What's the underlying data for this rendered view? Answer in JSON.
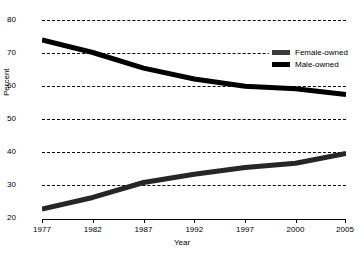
{
  "chart_data": {
    "type": "line",
    "title": "",
    "xlabel": "Year",
    "ylabel": "Percent",
    "xlim": [
      1977,
      2005
    ],
    "ylim": [
      20,
      80
    ],
    "grid": true,
    "legend_position": "top-right",
    "xticks": [
      1977,
      1982,
      1987,
      1992,
      1997,
      2000,
      2005
    ],
    "xtick_labels": [
      "1977",
      "1982",
      "1987",
      "1992",
      "1997",
      "2000",
      "2005"
    ],
    "xtick_positions_pct": [
      0,
      16.7,
      33.4,
      50.1,
      66.8,
      83.4,
      100
    ],
    "yticks": [
      20,
      30,
      40,
      50,
      60,
      70,
      80
    ],
    "ytick_labels": [
      "20",
      "30",
      "40",
      "50",
      "60",
      "70",
      "80"
    ],
    "series": [
      {
        "name": "Female-owned",
        "color": "#262626",
        "x": [
          1977,
          1982,
          1987,
          1992,
          1997,
          2000,
          2005
        ],
        "values": [
          23.0,
          26.5,
          31.0,
          33.5,
          35.5,
          36.8,
          39.8
        ]
      },
      {
        "name": "Male-owned",
        "color": "#000000",
        "x": [
          1977,
          1982,
          1987,
          1992,
          1997,
          2000,
          2005
        ],
        "values": [
          74.0,
          70.2,
          65.5,
          62.2,
          60.0,
          59.3,
          57.5
        ]
      }
    ]
  },
  "legend": {
    "items": [
      {
        "label": "Female-owned",
        "swatch_color": "#3a3a3a"
      },
      {
        "label": "Male-owned",
        "swatch_color": "#000000"
      }
    ]
  }
}
